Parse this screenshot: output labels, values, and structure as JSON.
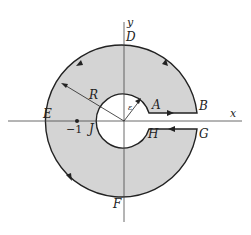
{
  "diagram": {
    "colors": {
      "fill": "#d4d4d4",
      "stroke": "#222222",
      "axis": "#444444"
    },
    "axes": {
      "x_label": "x",
      "y_label": "y"
    },
    "points": {
      "A": "A",
      "B": "B",
      "D": "D",
      "E": "E",
      "F": "F",
      "G": "G",
      "H": "H",
      "J": "J"
    },
    "radius_outer": "R",
    "radius_inner": "ε",
    "pole_label": "−1"
  }
}
